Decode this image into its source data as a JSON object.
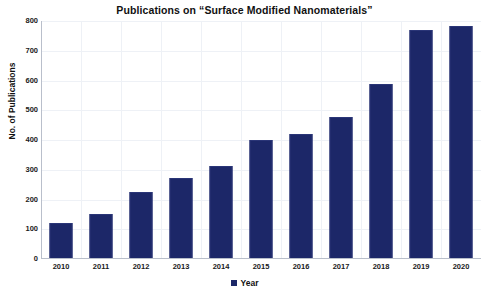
{
  "chart_data": {
    "type": "bar",
    "title": "Publications on “Surface Modified Nanomaterials”",
    "xlabel": "Year",
    "ylabel": "No. of Publications",
    "categories": [
      "2010",
      "2011",
      "2012",
      "2013",
      "2014",
      "2015",
      "2016",
      "2017",
      "2018",
      "2019",
      "2020"
    ],
    "values": [
      115,
      145,
      220,
      265,
      305,
      393,
      412,
      472,
      583,
      763,
      775
    ],
    "ylim": [
      0,
      800
    ],
    "y_ticks": [
      0,
      100,
      200,
      300,
      400,
      500,
      600,
      700,
      800
    ],
    "y_tick_labels": [
      "0",
      "100",
      "200",
      "300",
      "400",
      "500",
      "600",
      "700",
      "800"
    ],
    "grid": true,
    "legend": [
      {
        "label": "Year",
        "color": "#1c2768"
      }
    ],
    "legend_position": "bottom",
    "bar_color": "#1c2768",
    "series": [
      {
        "name": "Year",
        "values": [
          115,
          145,
          220,
          265,
          305,
          393,
          412,
          472,
          583,
          763,
          775
        ]
      }
    ]
  },
  "colors": {
    "bar": "#1c2768",
    "bar_border": "#2a3577",
    "grid": "#eef1f6",
    "axis": "#b9bfcb",
    "text": "#111111",
    "background": "#ffffff"
  }
}
